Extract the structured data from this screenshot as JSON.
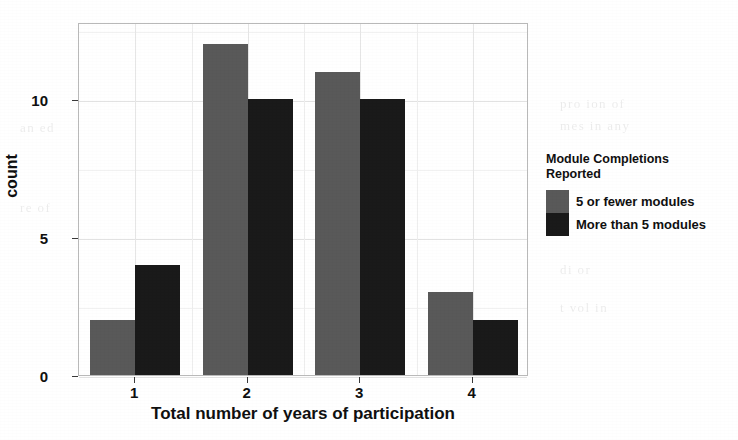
{
  "chart_data": {
    "type": "bar",
    "title": "",
    "subtitle": "",
    "xlabel": "Total number of years of participation",
    "ylabel": "count",
    "categories": [
      "1",
      "2",
      "3",
      "4"
    ],
    "series": [
      {
        "name": "5 or fewer modules",
        "color": "#595959",
        "values": [
          2,
          12,
          11,
          3
        ]
      },
      {
        "name": "More than 5 modules",
        "color": "#1a1a1a",
        "values": [
          4,
          10,
          10,
          2
        ]
      }
    ],
    "ylim": [
      0,
      12.8
    ],
    "y_ticks": [
      0,
      5,
      10
    ],
    "y_tick_labels": [
      "0",
      "5",
      "10"
    ],
    "x_tick_labels": [
      "1",
      "2",
      "3",
      "4"
    ],
    "grid": "horizontal-major-and-minor, light gray",
    "legend": {
      "title": "Module Completions\nReported",
      "position": "right",
      "entries": [
        {
          "label": "5 or fewer modules",
          "color": "#595959"
        },
        {
          "label": "More than 5 modules",
          "color": "#1a1a1a"
        }
      ]
    },
    "panel": {
      "background": "#ffffff",
      "border_color": "#b9b9b9"
    }
  },
  "axes": {
    "y": {
      "title": "count",
      "ticks": [
        {
          "label": "10",
          "value": 10
        },
        {
          "label": "5",
          "value": 5
        },
        {
          "label": "0",
          "value": 0
        }
      ]
    },
    "x": {
      "title": "Total number of years of participation",
      "ticks": [
        {
          "label": "1"
        },
        {
          "label": "2"
        },
        {
          "label": "3"
        },
        {
          "label": "4"
        }
      ]
    }
  },
  "legend": {
    "title_line1": "Module Completions",
    "title_line2": "Reported",
    "entries": [
      {
        "label": "5 or fewer modules",
        "color": "#595959"
      },
      {
        "label": "More than 5 modules",
        "color": "#1a1a1a"
      }
    ]
  },
  "scan_artifacts": {
    "ghost_lines": [
      {
        "text": "le  not",
        "x": 120,
        "y": 22,
        "size": 15
      },
      {
        "text": "ion  in  the",
        "x": 300,
        "y": 20,
        "size": 15
      },
      {
        "text": "pro   ion  of",
        "x": 560,
        "y": 96,
        "size": 13
      },
      {
        "text": "mes  in  any",
        "x": 560,
        "y": 118,
        "size": 13
      },
      {
        "text": "di  or",
        "x": 560,
        "y": 262,
        "size": 13
      },
      {
        "text": "t   vol   in",
        "x": 560,
        "y": 300,
        "size": 13
      },
      {
        "text": "an  ed",
        "x": 20,
        "y": 120,
        "size": 13
      },
      {
        "text": "re  of",
        "x": 20,
        "y": 200,
        "size": 13
      }
    ]
  }
}
